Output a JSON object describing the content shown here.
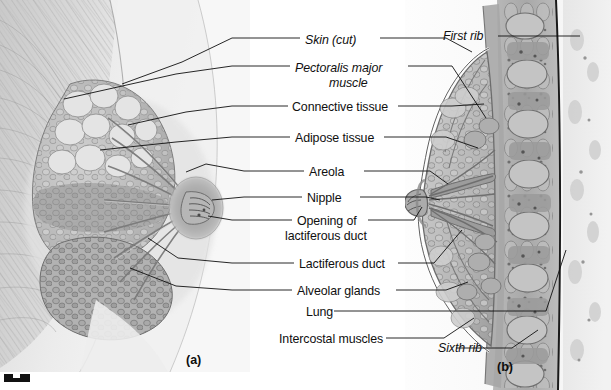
{
  "figure": {
    "panel_a_tag": "(a)",
    "panel_b_tag": "(b)"
  },
  "labels": {
    "skin_cut": "Skin (cut)",
    "pectoralis_line1": "Pectoralis major",
    "pectoralis_line2": "muscle",
    "connective_tissue": "Connective tissue",
    "adipose_tissue": "Adipose tissue",
    "areola": "Areola",
    "nipple": "Nipple",
    "opening_line1": "Opening of",
    "opening_line2": "lactiferous duct",
    "lactiferous_duct": "Lactiferous duct",
    "alveolar_glands": "Alveolar glands",
    "lung": "Lung",
    "intercostal_muscles": "Intercostal muscles",
    "first_rib": "First rib",
    "sixth_rib": "Sixth rib"
  },
  "colors": {
    "ink": "#101010",
    "paper": "#ffffff",
    "tissue_light": "#dcdcdc",
    "tissue_mid": "#b4b4b4",
    "tissue_dark": "#8a8a8a",
    "pleura": "#1a1a1a"
  }
}
